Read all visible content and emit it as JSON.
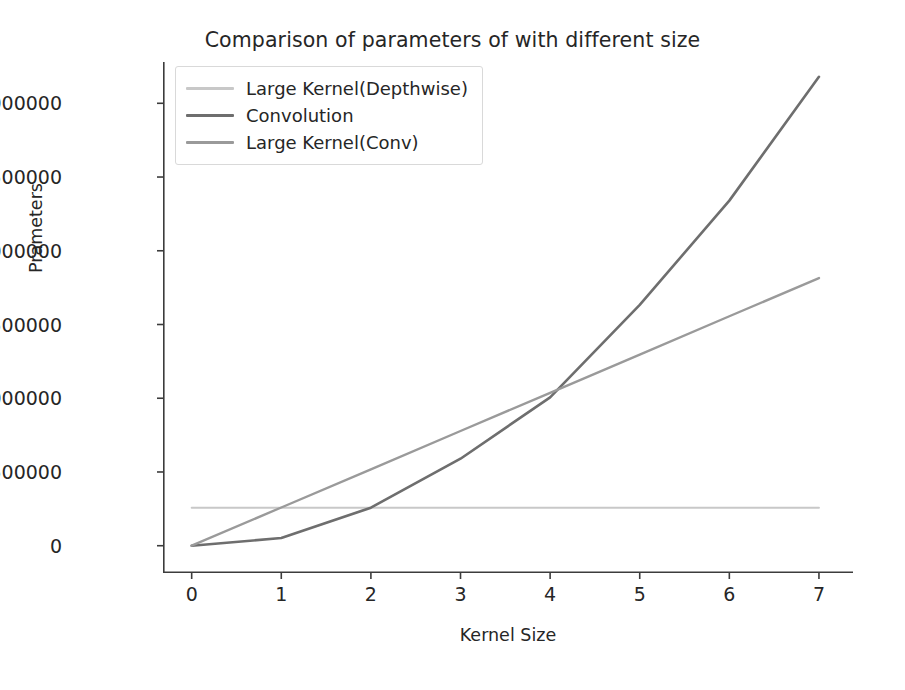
{
  "chart_data": {
    "type": "line",
    "title": "Comparison of parameters of with different size",
    "xlabel": "Kernel Size",
    "ylabel": "Prameters",
    "x": [
      0,
      1,
      2,
      3,
      4,
      5,
      6,
      7
    ],
    "xticks": [
      "0",
      "1",
      "2",
      "3",
      "4",
      "5",
      "6",
      "7"
    ],
    "yticks": [
      "0",
      "500000",
      "1000000",
      "1500000",
      "2000000",
      "2500000",
      "3000000"
    ],
    "ytick_values": [
      0,
      500000,
      1000000,
      1500000,
      2000000,
      2500000,
      3000000
    ],
    "xlim": [
      -0.32,
      7.38
    ],
    "ylim": [
      -185000,
      3280000
    ],
    "grid": false,
    "legend_position": "upper left",
    "series": [
      {
        "name": "Large Kernel(Depthwise)",
        "color": "#c8c8c8",
        "linewidth": 2.0,
        "values": [
          258000,
          258000,
          258000,
          258000,
          258000,
          258000,
          258000,
          258000
        ]
      },
      {
        "name": "Convolution",
        "color": "#6e6e6e",
        "linewidth": 2.6,
        "values": [
          0,
          52000,
          258000,
          590000,
          1006000,
          1633000,
          2340000,
          3180000
        ]
      },
      {
        "name": "Large Kernel(Conv)",
        "color": "#9a9a9a",
        "linewidth": 2.4,
        "values": [
          0,
          259000,
          518000,
          778000,
          1037000,
          1296000,
          1556000,
          1815000
        ]
      }
    ]
  },
  "legend": {
    "items": [
      {
        "label": "Large Kernel(Depthwise)",
        "color": "#c8c8c8"
      },
      {
        "label": "Convolution",
        "color": "#6e6e6e"
      },
      {
        "label": "Large Kernel(Conv)",
        "color": "#9a9a9a"
      }
    ]
  },
  "colors": {
    "background": "#ffffff",
    "axis": "#3c3c3c",
    "text": "#262626",
    "legend_border": "#d9d9d9"
  }
}
